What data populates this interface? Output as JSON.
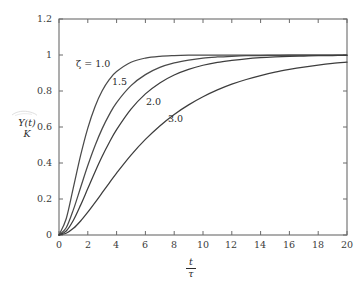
{
  "chart_data": {
    "type": "line",
    "title": "",
    "xlabel": "t/τ",
    "ylabel": "Y(t)/K",
    "xlim": [
      0,
      20
    ],
    "ylim": [
      0,
      1.2
    ],
    "grid": false,
    "legend_position": "inline-curve-labels",
    "xticks": [
      0,
      2,
      4,
      6,
      8,
      10,
      12,
      14,
      16,
      18,
      20
    ],
    "xtick_labels": [
      "0",
      "2",
      "4",
      "6",
      "8",
      "10",
      "12",
      "14",
      "16",
      "18",
      "20"
    ],
    "yticks": [
      0,
      0.2,
      0.4,
      0.6,
      0.8,
      1,
      1.2
    ],
    "ytick_labels": [
      "0",
      "0.2",
      "0.4",
      "0.6",
      "0.8",
      "1",
      "1.2"
    ],
    "x": [
      0,
      0.5,
      1,
      1.5,
      2,
      2.5,
      3,
      3.5,
      4,
      5,
      6,
      7,
      8,
      9,
      10,
      11,
      12,
      13,
      14,
      15,
      16,
      17,
      18,
      19,
      20
    ],
    "series": [
      {
        "name": "ζ = 1.0",
        "zeta": 1.0,
        "label": "ζ = 1.0",
        "color": "#4a4a4a",
        "values": [
          0,
          0.09,
          0.264,
          0.442,
          0.594,
          0.713,
          0.801,
          0.864,
          0.908,
          0.96,
          0.983,
          0.993,
          0.997,
          0.999,
          0.9995,
          0.9998,
          0.9999,
          1.0,
          1.0,
          1.0,
          1.0,
          1.0,
          1.0,
          1.0,
          1.0
        ]
      },
      {
        "name": "1.5",
        "zeta": 1.5,
        "label": "1.5",
        "color": "#4a4a4a",
        "values": [
          0,
          0.04,
          0.141,
          0.264,
          0.386,
          0.496,
          0.591,
          0.67,
          0.736,
          0.83,
          0.891,
          0.931,
          0.956,
          0.972,
          0.983,
          0.989,
          0.993,
          0.996,
          0.997,
          0.998,
          0.999,
          0.9993,
          0.9996,
          0.9997,
          0.9998
        ]
      },
      {
        "name": "2.0",
        "zeta": 2.0,
        "label": "2.0",
        "color": "#3d3d3d",
        "values": [
          0,
          0.022,
          0.082,
          0.166,
          0.258,
          0.35,
          0.437,
          0.515,
          0.585,
          0.699,
          0.784,
          0.845,
          0.889,
          0.92,
          0.943,
          0.959,
          0.97,
          0.979,
          0.985,
          0.989,
          0.992,
          0.994,
          0.996,
          0.997,
          0.998
        ]
      },
      {
        "name": "3.0",
        "zeta": 3.0,
        "label": "3.0",
        "color": "#3d3d3d",
        "values": [
          0,
          0.01,
          0.037,
          0.078,
          0.127,
          0.18,
          0.235,
          0.29,
          0.344,
          0.444,
          0.531,
          0.606,
          0.67,
          0.723,
          0.768,
          0.806,
          0.838,
          0.864,
          0.886,
          0.905,
          0.92,
          0.933,
          0.944,
          0.953,
          0.96
        ]
      }
    ],
    "curve_labels": [
      {
        "text": "ζ = 1.0",
        "x_px": 76,
        "y_px": 58
      },
      {
        "text": "1.5",
        "x_px": 112,
        "y_px": 76
      },
      {
        "text": "2.0",
        "x_px": 146,
        "y_px": 96
      },
      {
        "text": "3.0",
        "x_px": 168,
        "y_px": 113
      }
    ]
  },
  "axes": {
    "y_title_numerator": "Y(t)",
    "y_title_denominator": "K",
    "x_title_numerator": "t",
    "x_title_denominator": "τ"
  }
}
